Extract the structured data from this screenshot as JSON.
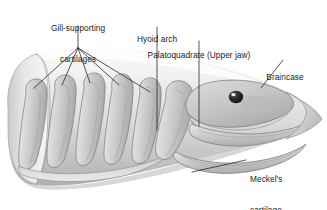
{
  "figure": {
    "type": "anatomical-diagram",
    "background_color": "#ffffff",
    "body_fill_light": "#e8e8e6",
    "body_fill_mid": "#cfd0cd",
    "body_fill_dark": "#a9aaa7",
    "outline_color": "#6e7170",
    "leader_color": "#1f1f1f",
    "text_color": "#1b1b1b"
  },
  "labels": [
    {
      "id": "gill-supporting-cartilages",
      "line1": "Gill-supporting",
      "line2": "cartilages",
      "align": "center",
      "x": 78,
      "y": 3
    },
    {
      "id": "hyoid-arch",
      "line1": "Hyoid arch",
      "line2": "",
      "align": "center",
      "x": 157,
      "y": 14
    },
    {
      "id": "palatoquadrate-upper-jaw",
      "line1": "Palatoquadrate (Upper jaw)",
      "line2": "",
      "align": "center",
      "x": 199,
      "y": 30
    },
    {
      "id": "braincase",
      "line1": "Braincase",
      "line2": "",
      "align": "center",
      "x": 285,
      "y": 53
    },
    {
      "id": "meckels-cartilage-lower-jaw",
      "line1": "Meckel's",
      "line2": "cartilage",
      "line3": "(lower jaw)",
      "align": "left",
      "x": 250,
      "y": 154
    }
  ],
  "structures": {
    "gill_arch_count": 5,
    "gill_arches": [
      "arch 1",
      "arch 2",
      "arch 3",
      "arch 4",
      "arch 5"
    ],
    "eye": "dark pupil with white highlight",
    "parts": [
      "gill-supporting cartilages",
      "hyoid arch",
      "palatoquadrate (upper jaw)",
      "braincase",
      "Meckel's cartilage (lower jaw)"
    ]
  }
}
